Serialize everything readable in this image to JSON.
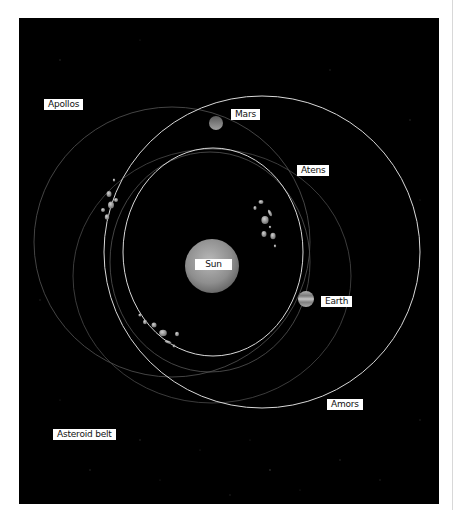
{
  "diagram": {
    "background_color": "#000000",
    "labels": {
      "apollos": "Apollos",
      "mars": "Mars",
      "atens": "Atens",
      "sun": "Sun",
      "earth": "Earth",
      "amors": "Amors",
      "asteroid_belt": "Asteroid belt"
    },
    "bodies": [
      {
        "name": "Sun",
        "cx": 212,
        "cy": 266,
        "r": 27,
        "color": "#9a9a9a"
      },
      {
        "name": "Mars",
        "cx": 216,
        "cy": 123,
        "r": 7,
        "color": "#8a8a8a"
      },
      {
        "name": "Earth",
        "cx": 306,
        "cy": 299,
        "r": 8,
        "color": "#a0a0a0"
      }
    ],
    "orbits": [
      {
        "name": "Earth orbit",
        "cx": 213,
        "cy": 252,
        "rx": 90,
        "ry": 104,
        "style": "bright"
      },
      {
        "name": "Mars orbit",
        "cx": 262,
        "cy": 252,
        "rx": 158,
        "ry": 156,
        "style": "bright"
      },
      {
        "name": "Apollos orbit",
        "cx": 172,
        "cy": 242,
        "rx": 138,
        "ry": 135,
        "style": "faint"
      },
      {
        "name": "Atens orbit",
        "cx": 210,
        "cy": 262,
        "rx": 100,
        "ry": 110,
        "style": "faint"
      },
      {
        "name": "Amors orbit",
        "cx": 212,
        "cy": 276,
        "rx": 139,
        "ry": 127,
        "style": "faint"
      }
    ]
  }
}
